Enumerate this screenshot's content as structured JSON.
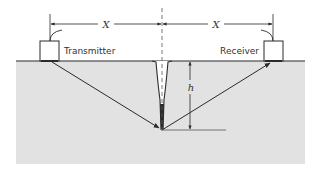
{
  "diagram": {
    "labels": {
      "transmitter": "Transmitter",
      "receiver": "Receiver",
      "left_distance": "X",
      "right_distance": "X",
      "depth": "h"
    },
    "colors": {
      "material": "#e2e2e2",
      "line": "#2a2a2a",
      "background": "#ffffff"
    },
    "elements": [
      {
        "id": "test-block",
        "type": "rectangle",
        "desc": "gray material cross-section"
      },
      {
        "id": "transmitter-probe",
        "type": "box",
        "label_ref": "transmitter"
      },
      {
        "id": "receiver-probe",
        "type": "box",
        "label_ref": "receiver"
      },
      {
        "id": "crack",
        "type": "notch",
        "desc": "V-shaped surface-breaking crack"
      },
      {
        "id": "centerline",
        "type": "dashed-line"
      },
      {
        "id": "incident-ray",
        "type": "arrow",
        "from": "transmitter",
        "to": "crack-tip"
      },
      {
        "id": "diffracted-ray",
        "type": "arrow",
        "from": "crack-tip",
        "to": "receiver"
      },
      {
        "id": "depth-dimension",
        "type": "double-arrow",
        "label_ref": "depth"
      },
      {
        "id": "separation-dimension",
        "type": "double-arrow",
        "label_ref": "left_distance"
      }
    ]
  }
}
